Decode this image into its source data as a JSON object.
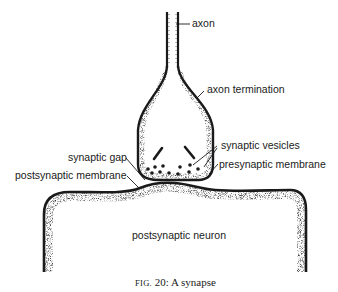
{
  "figure": {
    "title_prefix": "Fig.",
    "title_rest": " 20: A synapse",
    "full_caption": "FIG. 20: A synapse"
  },
  "labels": {
    "axon": "axon",
    "axon_termination": "axon termination",
    "synaptic_vesicles": "synaptic vesicles",
    "presynaptic_membrane": "presynaptic membrane",
    "synaptic_gap": "synaptic gap",
    "postsynaptic_membrane": "postsynaptic membrane",
    "postsynaptic_neuron": "postsynaptic neuron"
  },
  "colors": {
    "ink": "#1a1a1a",
    "background": "#ffffff"
  }
}
